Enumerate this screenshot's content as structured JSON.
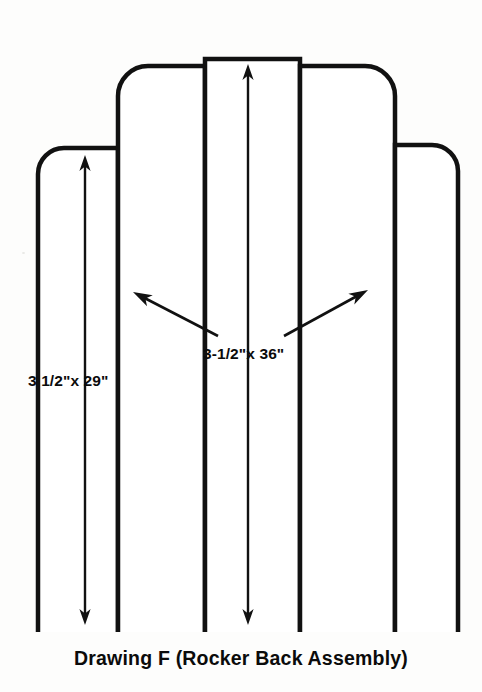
{
  "drawing": {
    "caption": "Drawing F (Rocker Back Assembly)",
    "background_color": "#fdfdfc",
    "ink_color": "#111111",
    "dimensions": [
      {
        "id": "outer-slat",
        "label": "3 1/2\"x 29\"",
        "length_in": 29,
        "width_in": 3.5,
        "label_x": 28,
        "label_y": 386,
        "arrow": {
          "x": 85,
          "y_top": 155,
          "y_bottom": 625
        }
      },
      {
        "id": "inner-slat",
        "label": "3-1/2\"x 36\"",
        "length_in": 36,
        "width_in": 3.5,
        "label_x": 203,
        "label_y": 359,
        "arrow": {
          "x": 248,
          "y_top": 64,
          "y_bottom": 625
        }
      }
    ],
    "leaders": [
      {
        "id": "leader-left",
        "tail_x": 218,
        "tail_y": 336,
        "tip_x": 133,
        "tip_y": 292
      },
      {
        "id": "leader-right",
        "tail_x": 284,
        "tail_y": 336,
        "tip_x": 368,
        "tip_y": 290
      }
    ],
    "boards": [
      {
        "id": "board-1",
        "x": 38,
        "width": 80,
        "top": 148,
        "bottom": 632,
        "radius_top_left": 26,
        "radius_top_right": 0
      },
      {
        "id": "board-2",
        "x": 118,
        "width": 87,
        "top": 66,
        "bottom": 632,
        "radius_top_left": 30,
        "radius_top_right": 0
      },
      {
        "id": "board-3",
        "x": 205,
        "width": 95,
        "top": 59,
        "bottom": 632,
        "radius_top_left": 0,
        "radius_top_right": 0
      },
      {
        "id": "board-4",
        "x": 300,
        "width": 95,
        "top": 66,
        "bottom": 632,
        "radius_top_left": 0,
        "radius_top_right": 30
      },
      {
        "id": "board-5",
        "x": 395,
        "width": 63,
        "top": 145,
        "bottom": 632,
        "radius_top_left": 0,
        "radius_top_right": 26
      }
    ]
  }
}
